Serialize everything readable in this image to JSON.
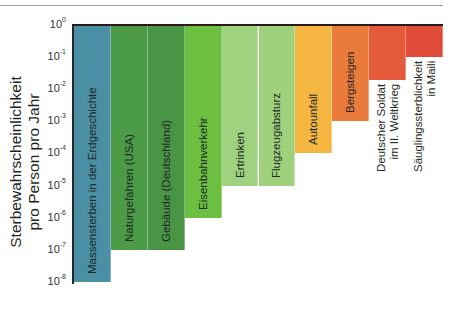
{
  "chart_data": {
    "type": "bar",
    "title": "",
    "xlabel": "",
    "ylabel": "Sterbewahrscheinlichkeit pro Person pro Jahr",
    "ylabel_lines": [
      "Sterbewahrscheinlichkeit",
      "pro Person pro Jahr"
    ],
    "yscale": "log",
    "ylim": [
      1e-08,
      1
    ],
    "yticks": [
      "10^0",
      "10^-1",
      "10^-2",
      "10^-3",
      "10^-4",
      "10^-5",
      "10^-6",
      "10^-7",
      "10^-8"
    ],
    "ytick_exponents": [
      "0",
      "-1",
      "-2",
      "-3",
      "-4",
      "-5",
      "-6",
      "-7",
      "-8"
    ],
    "bars_hang_from_top": true,
    "categories": [
      "Massensterben in der Erdgeschichte",
      "Naturgefahren (USA)",
      "Gebäude (Deutschland)",
      "Eisenbahnverkehr",
      "Ertrinken",
      "Flugzeugabsturz",
      "Autounfall",
      "Bergsteigen",
      "Deutscher Soldat im II. Weltkrieg",
      "Säuglingssterblichkeit in Maili"
    ],
    "values": [
      1e-08,
      1e-07,
      1e-07,
      1e-06,
      1e-05,
      1e-05,
      0.0001,
      0.001,
      0.02,
      0.1
    ],
    "bars": [
      {
        "label_lines": [
          "Massensterben in der Erdgeschichte"
        ],
        "value": 1e-08,
        "log": -8,
        "color": "#4a8fa3",
        "label_inside": true
      },
      {
        "label_lines": [
          "Naturgefahren (USA)"
        ],
        "value": 1e-07,
        "log": -7,
        "color": "#4b9a46",
        "label_inside": true
      },
      {
        "label_lines": [
          "Gebäude (Deutschland)"
        ],
        "value": 1e-07,
        "log": -7,
        "color": "#4a9446",
        "label_inside": true
      },
      {
        "label_lines": [
          "Eisenbahnverkehr"
        ],
        "value": 1e-06,
        "log": -6,
        "color": "#6cbf3f",
        "label_inside": true
      },
      {
        "label_lines": [
          "Ertrinken"
        ],
        "value": 1e-05,
        "log": -5,
        "color": "#9fd27e",
        "label_inside": true
      },
      {
        "label_lines": [
          "Flugzeugabsturz"
        ],
        "value": 1e-05,
        "log": -5,
        "color": "#9dd17c",
        "label_inside": true
      },
      {
        "label_lines": [
          "Autounfall"
        ],
        "value": 0.0001,
        "log": -4,
        "color": "#f4b640",
        "label_inside": true
      },
      {
        "label_lines": [
          "Bergsteigen"
        ],
        "value": 0.001,
        "log": -3,
        "color": "#ea7b3b",
        "label_inside": true
      },
      {
        "label_lines": [
          "Deutscher Soldat",
          "im II. Weltkrieg"
        ],
        "value": 0.02,
        "log": -1.7,
        "color": "#e55a3b",
        "label_inside": false
      },
      {
        "label_lines": [
          "Säuglingssterblichkeit",
          "in Maili"
        ],
        "value": 0.1,
        "log": -1,
        "color": "#e04b39",
        "label_inside": false
      }
    ],
    "grid": false,
    "legend": null
  }
}
